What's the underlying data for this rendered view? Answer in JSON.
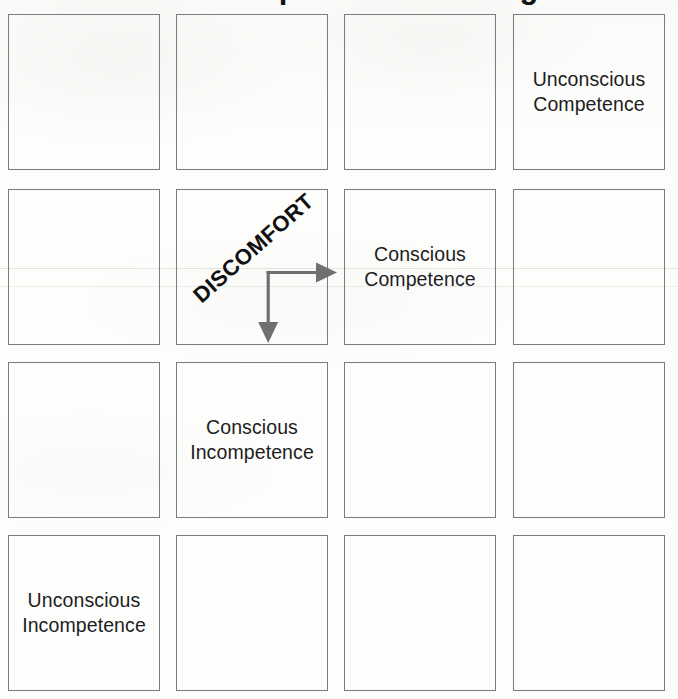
{
  "diagram": {
    "title": "Conscious Competence Learning Model",
    "annotation": {
      "label": "DISCOMFORT",
      "arrow_right_name": "arrow-right",
      "arrow_down_name": "arrow-down",
      "arrow_color": "#6f6f6f"
    },
    "style": {
      "box_border_color": "#6e6e6e",
      "text_color": "#1d1d1d",
      "background_color": "#fdfdfc"
    },
    "grid": {
      "columns": 4,
      "rows": 4,
      "cells": [
        {
          "id": "r1c1",
          "row": 1,
          "col": 1,
          "label": ""
        },
        {
          "id": "r1c2",
          "row": 1,
          "col": 2,
          "label": ""
        },
        {
          "id": "r1c3",
          "row": 1,
          "col": 3,
          "label": ""
        },
        {
          "id": "r1c4",
          "row": 1,
          "col": 4,
          "label": "Unconscious\nCompetence"
        },
        {
          "id": "r2c1",
          "row": 2,
          "col": 1,
          "label": ""
        },
        {
          "id": "r2c2",
          "row": 2,
          "col": 2,
          "label": ""
        },
        {
          "id": "r2c3",
          "row": 2,
          "col": 3,
          "label": "Conscious\nCompetence"
        },
        {
          "id": "r2c4",
          "row": 2,
          "col": 4,
          "label": ""
        },
        {
          "id": "r3c1",
          "row": 3,
          "col": 1,
          "label": ""
        },
        {
          "id": "r3c2",
          "row": 3,
          "col": 2,
          "label": "Conscious\nIncompetence"
        },
        {
          "id": "r3c3",
          "row": 3,
          "col": 3,
          "label": ""
        },
        {
          "id": "r3c4",
          "row": 3,
          "col": 4,
          "label": ""
        },
        {
          "id": "r4c1",
          "row": 4,
          "col": 1,
          "label": "Unconscious\nIncompetence"
        },
        {
          "id": "r4c2",
          "row": 4,
          "col": 2,
          "label": ""
        },
        {
          "id": "r4c3",
          "row": 4,
          "col": 3,
          "label": ""
        },
        {
          "id": "r4c4",
          "row": 4,
          "col": 4,
          "label": ""
        }
      ]
    }
  }
}
